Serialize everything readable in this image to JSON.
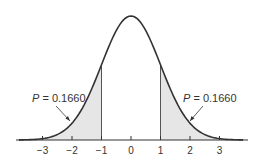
{
  "chart_data": {
    "type": "area",
    "title": "",
    "xlabel": "",
    "ylabel": "",
    "distribution": "standard normal",
    "xlim": [
      -3.8,
      3.8
    ],
    "ticks": [
      -3,
      -2,
      -1,
      0,
      1,
      2,
      3
    ],
    "tick_labels": [
      "−3",
      "−2",
      "−1",
      "0",
      "1",
      "2",
      "3"
    ],
    "shaded_regions": [
      {
        "name": "left-tail",
        "from": -3.8,
        "to": -1,
        "probability": 0.166
      },
      {
        "name": "right-tail",
        "from": 1,
        "to": 3.8,
        "probability": 0.166
      }
    ],
    "annotations": [
      {
        "text_italic": "P",
        "text": " = 0.1660",
        "points_to": "left-tail"
      },
      {
        "text_italic": "P",
        "text": " = 0.1660",
        "points_to": "right-tail"
      }
    ],
    "colors": {
      "curve": "#333333",
      "shade": "#e6e6e6"
    }
  }
}
